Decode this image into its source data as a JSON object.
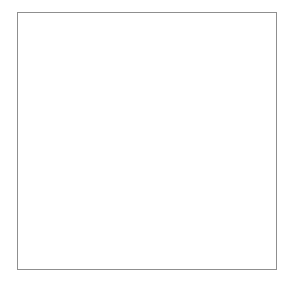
{
  "figure": {
    "y_axis_title": "Number of lost-time injuries\nper million person-hours",
    "y_axis_title_line1": "Number of lost-time injuries",
    "y_axis_title_line2": "per million person-hours",
    "x_axis_title": "Years",
    "phase_labels": {
      "baseline": "Baseline",
      "treatment": "Token economy"
    }
  },
  "chart_data": [
    {
      "type": "line",
      "panel": "top",
      "name": "Shirley basin",
      "series_label": "Shirley basin",
      "title": "",
      "xlabel": "",
      "ylabel": "Number of lost-time injuries per million person-hours",
      "xlim": [
        1969.0,
        1986.2
      ],
      "ylim": [
        0,
        46
      ],
      "yticks": [
        0,
        20,
        40
      ],
      "ytick_labels": [
        "0",
        "20",
        "40"
      ],
      "yminor": [
        10,
        30
      ],
      "xticks": [
        1970,
        1971,
        1972,
        1973,
        1974,
        1975,
        1976,
        1977,
        1978,
        1979,
        1980,
        1981,
        1982,
        1983,
        1984,
        1985,
        1986
      ],
      "xtick_labels": [],
      "grid": false,
      "phase_change_x": 1971.4,
      "phase_change_label": "Token economy onset",
      "x": [
        1970,
        1971,
        1972,
        1973,
        1974,
        1975,
        1976,
        1977,
        1978,
        1979,
        1980,
        1981,
        1982,
        1983,
        1984,
        1985
      ],
      "values": [
        42,
        34,
        18.5,
        6,
        4.5,
        4.5,
        4.5,
        8,
        3.5,
        8.5,
        4,
        4,
        11,
        6.5,
        9,
        null
      ],
      "points": [
        {
          "x": 1970,
          "y": 42
        },
        {
          "x": 1971,
          "y": 34
        },
        {
          "x": 1972,
          "y": 18.5
        },
        {
          "x": 1973,
          "y": 6
        },
        {
          "x": 1974,
          "y": 4.5
        },
        {
          "x": 1975,
          "y": 4.5
        },
        {
          "x": 1976,
          "y": 4.5
        },
        {
          "x": 1977,
          "y": 8
        },
        {
          "x": 1978,
          "y": 3.5
        },
        {
          "x": 1979,
          "y": 8.5
        },
        {
          "x": 1980,
          "y": 4
        },
        {
          "x": 1981,
          "y": 4
        },
        {
          "x": 1982,
          "y": 11
        },
        {
          "x": 1983,
          "y": 6.5
        },
        {
          "x": 1984,
          "y": 9
        }
      ]
    },
    {
      "type": "line",
      "panel": "bottom",
      "name": "Navajo",
      "series_label": "Navajo",
      "title": "",
      "xlabel": "Years",
      "ylabel": "Number of lost-time injuries per million person-hours",
      "xlim": [
        1969.0,
        1986.2
      ],
      "ylim": [
        0,
        46
      ],
      "yticks": [
        0,
        20,
        40
      ],
      "ytick_labels": [
        "0",
        "20",
        "40"
      ],
      "yminor": [
        10,
        30
      ],
      "xticks": [
        1970,
        1971,
        1972,
        1973,
        1974,
        1975,
        1976,
        1977,
        1978,
        1979,
        1980,
        1981,
        1982,
        1983,
        1984,
        1985
      ],
      "xtick_labels": [
        "1970",
        "",
        "",
        "",
        "",
        "1975",
        "",
        "",
        "",
        "",
        "1980",
        "",
        "",
        "",
        "",
        "1985"
      ],
      "labeled_xticks": [
        1970,
        1975,
        1980,
        1985
      ],
      "labeled_xtick_labels": [
        "1970",
        "1975",
        "1980",
        "1985"
      ],
      "grid": false,
      "phase_change_x": 1974.5,
      "phase_change_label": "Token economy onset",
      "x": [
        1970,
        1971,
        1972,
        1973,
        1974,
        1975,
        1976,
        1977,
        1978,
        1979,
        1980,
        1981,
        1982,
        1983,
        1984,
        1985
      ],
      "values": [
        42,
        30,
        18.5,
        26.5,
        28,
        29.5,
        10,
        13.5,
        14.5,
        4,
        11.5,
        5.5,
        3.5,
        8,
        15.5,
        6.5
      ],
      "points": [
        {
          "x": 1970,
          "y": 42
        },
        {
          "x": 1971,
          "y": 30
        },
        {
          "x": 1972,
          "y": 18.5
        },
        {
          "x": 1973,
          "y": 26.5
        },
        {
          "x": 1974,
          "y": 28
        },
        {
          "x": 1975,
          "y": 29.5
        },
        {
          "x": 1976,
          "y": 10
        },
        {
          "x": 1977,
          "y": 13.5
        },
        {
          "x": 1978,
          "y": 14.5
        },
        {
          "x": 1979,
          "y": 4
        },
        {
          "x": 1980,
          "y": 11.5
        },
        {
          "x": 1981,
          "y": 5.5
        },
        {
          "x": 1982,
          "y": 3.5
        },
        {
          "x": 1983,
          "y": 8
        },
        {
          "x": 1984,
          "y": 15.5
        },
        {
          "x": 1985,
          "y": 6.5
        }
      ]
    }
  ],
  "colors": {
    "marker": "#000000",
    "line": "#000000",
    "axis": "#000000",
    "phase_divider": "#808080",
    "frame": "#8f8f8f",
    "text": "#1a1a1a",
    "background": "#ffffff"
  }
}
